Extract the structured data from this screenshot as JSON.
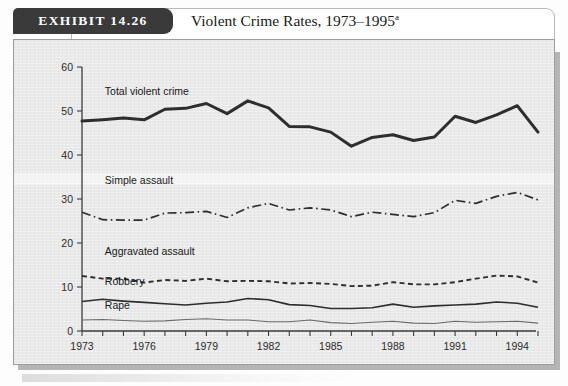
{
  "exhibit": {
    "badge_label": "EXHIBIT 14.26",
    "title": "Violent Crime Rates, 1973–1995",
    "title_superscript": "a"
  },
  "chart_data": {
    "type": "line",
    "title": "Violent Crime Rates, 1973–1995",
    "xlabel": "",
    "ylabel": "",
    "xlim": [
      1973,
      1995
    ],
    "ylim": [
      0,
      60
    ],
    "ytick_values": [
      0,
      10,
      20,
      30,
      40,
      50,
      60
    ],
    "ytick_labels": [
      "0",
      "10",
      "20",
      "30",
      "40",
      "50",
      "60"
    ],
    "xtick_values": [
      1973,
      1974,
      1975,
      1976,
      1977,
      1978,
      1979,
      1980,
      1981,
      1982,
      1983,
      1984,
      1985,
      1986,
      1987,
      1988,
      1989,
      1990,
      1991,
      1992,
      1993,
      1994,
      1995
    ],
    "xtick_labels_shown": [
      "1973",
      "1976",
      "1979",
      "1982",
      "1985",
      "1988",
      "1991",
      "1994"
    ],
    "grid": false,
    "legend_position": "inline-labels",
    "x": [
      1973,
      1974,
      1975,
      1976,
      1977,
      1978,
      1979,
      1980,
      1981,
      1982,
      1983,
      1984,
      1985,
      1986,
      1987,
      1988,
      1989,
      1990,
      1991,
      1992,
      1993,
      1994,
      1995
    ],
    "series": [
      {
        "name": "Total violent crime",
        "style": "solid-thick",
        "values": [
          47.7,
          48.0,
          48.4,
          48.0,
          50.4,
          50.6,
          51.7,
          49.4,
          52.3,
          50.7,
          46.5,
          46.4,
          45.2,
          42.0,
          44.0,
          44.6,
          43.3,
          44.1,
          48.8,
          47.4,
          49.1,
          51.2,
          45.2
        ]
      },
      {
        "name": "Simple assault",
        "style": "dash-dot",
        "values": [
          27.0,
          25.3,
          25.2,
          25.2,
          26.8,
          26.9,
          27.2,
          25.8,
          28.0,
          29.0,
          27.5,
          28.0,
          27.5,
          26.0,
          27.0,
          26.5,
          26.0,
          26.9,
          29.7,
          29.0,
          30.6,
          31.5,
          29.8
        ]
      },
      {
        "name": "Aggravated assault",
        "style": "dashed",
        "values": [
          12.5,
          11.9,
          11.9,
          11.0,
          11.6,
          11.4,
          11.9,
          11.3,
          11.4,
          11.3,
          10.8,
          10.9,
          10.7,
          10.2,
          10.3,
          11.1,
          10.6,
          10.6,
          11.1,
          11.9,
          12.6,
          12.4,
          11.0
        ]
      },
      {
        "name": "Robbery",
        "style": "solid",
        "values": [
          6.7,
          7.2,
          6.8,
          6.5,
          6.2,
          5.9,
          6.3,
          6.6,
          7.4,
          7.1,
          6.0,
          5.8,
          5.1,
          5.1,
          5.3,
          6.1,
          5.4,
          5.7,
          5.9,
          6.1,
          6.6,
          6.3,
          5.4
        ]
      },
      {
        "name": "Rape",
        "style": "solid-thin",
        "values": [
          2.5,
          2.6,
          2.4,
          2.2,
          2.3,
          2.6,
          2.8,
          2.5,
          2.5,
          2.1,
          2.1,
          2.5,
          1.9,
          1.7,
          2.0,
          2.2,
          1.8,
          1.7,
          2.2,
          2.0,
          2.1,
          2.2,
          1.8
        ]
      }
    ],
    "series_label_positions": [
      {
        "name": "Total violent crime",
        "x": 1974.1,
        "y": 53.6
      },
      {
        "name": "Simple assault",
        "x": 1974.1,
        "y": 33.4
      },
      {
        "name": "Aggravated assault",
        "x": 1974.1,
        "y": 17.3
      },
      {
        "name": "Robbery",
        "x": 1974.1,
        "y": 10.4
      },
      {
        "name": "Rape",
        "x": 1974.1,
        "y": 5.0
      }
    ]
  }
}
